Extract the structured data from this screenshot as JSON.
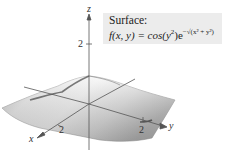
{
  "figure": {
    "type": "3d-surface-plot",
    "label_box": {
      "title": "Surface:",
      "formula_prefix": "f(x, y) = cos(y",
      "formula_sq": "2",
      "formula_mid": ")e",
      "formula_exp": "−√(x² + y²)",
      "formula_full": "f(x, y) = cos(y²)e^(−√(x² + y²))"
    },
    "axes": {
      "x": {
        "label": "x",
        "tick_label": "2"
      },
      "y": {
        "label": "y",
        "tick_label": "2"
      },
      "z": {
        "label": "z",
        "tick_label": "2"
      }
    },
    "colors": {
      "surface_light": "#f2f2f2",
      "surface_mid": "#c8c8c8",
      "surface_dark": "#8a8a8a",
      "axis": "#555555",
      "label_bg": "#ececec"
    }
  }
}
